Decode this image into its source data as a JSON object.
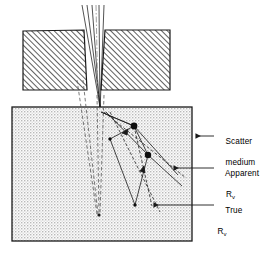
{
  "figure": {
    "background_color": "#ffffff",
    "line_color": "#1a1a1a",
    "hatch_color": "#2b2b2b",
    "stipple_color": "#9a9a9a",
    "medium_fill": "#f2f2f2"
  },
  "labels": {
    "scatter_medium_line1": "Scatter",
    "scatter_medium_line2": "medium",
    "apparent": "Apparent",
    "apparent_symbol": "R",
    "apparent_subscript": "v",
    "true": "True",
    "true_symbol": "R",
    "true_subscript": "v"
  },
  "collimator": {
    "left_block": {
      "x": 23,
      "y": 30,
      "width": 62,
      "height": 60,
      "hatch_angle_deg": 45
    },
    "right_block": {
      "x": 104,
      "y": 30,
      "width": 66,
      "height": 60,
      "hatch_angle_deg": 45
    },
    "gap_label": "collimator-gap"
  },
  "medium_box": {
    "x": 12,
    "y": 107,
    "width": 180,
    "height": 134
  },
  "beam": {
    "converging_rays": 5,
    "focus_x": 100,
    "focus_y": 112,
    "centerline_style": "dash-dot"
  },
  "scatter_events": [
    {
      "name": "event-1",
      "x": 134,
      "y": 126,
      "radius": 3.4
    },
    {
      "name": "event-2",
      "x": 110,
      "y": 139,
      "radius": 1.7
    },
    {
      "name": "event-3",
      "x": 148,
      "y": 155,
      "radius": 3.2
    },
    {
      "name": "event-4",
      "x": 135,
      "y": 205,
      "radius": 1.7
    }
  ],
  "leaders": [
    {
      "name": "scatter-medium-leader",
      "from_x": 214,
      "from_y": 136,
      "to_x": 194,
      "to_y": 136
    },
    {
      "name": "apparent-leader",
      "from_x": 214,
      "from_y": 168,
      "to_x": 172,
      "to_y": 168
    },
    {
      "name": "true-leader",
      "from_x": 214,
      "from_y": 205,
      "to_x": 152,
      "to_y": 205
    }
  ],
  "legend_meaning": {
    "solid_path": "Apparent R v scattered ray path",
    "dashed_path": "True R v unscattered ray path"
  }
}
